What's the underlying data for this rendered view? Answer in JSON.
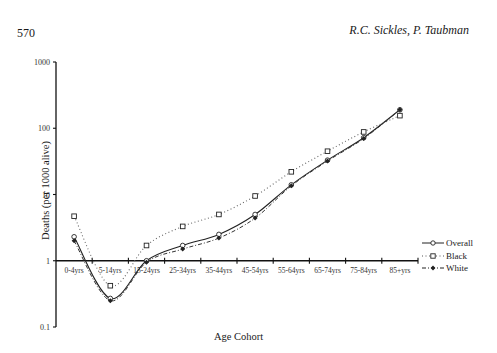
{
  "page": {
    "page_number": "570",
    "running_head": "R.C. Sickles, P. Taubman"
  },
  "chart_data": {
    "type": "line",
    "title": "",
    "xlabel": "Age Cohort",
    "ylabel": "Deaths (per 1000 alive)",
    "yscale": "log",
    "ylim": [
      0.1,
      1000
    ],
    "yticks": [
      "0.1",
      "1",
      "10",
      "100",
      "1000"
    ],
    "grid": false,
    "legend_position": "right",
    "categories": [
      "0-4yrs",
      "5-14yrs",
      "15-24yrs",
      "25-34yrs",
      "35-44yrs",
      "45-54yrs",
      "55-64yrs",
      "65-74yrs",
      "75-84yrs",
      "85+yrs"
    ],
    "series": [
      {
        "name": "Overall",
        "style": "solid",
        "marker": "open-circle",
        "values": [
          2.3,
          0.27,
          1.0,
          1.7,
          2.5,
          5.0,
          14,
          33,
          72,
          190
        ]
      },
      {
        "name": "Black",
        "style": "dotted",
        "marker": "open-square",
        "values": [
          4.7,
          0.42,
          1.7,
          3.3,
          5.0,
          9.5,
          22,
          45,
          88,
          155
        ]
      },
      {
        "name": "White",
        "style": "dash-dot",
        "marker": "filled-diamond",
        "values": [
          2.0,
          0.25,
          0.95,
          1.5,
          2.2,
          4.4,
          13.5,
          32,
          70,
          190
        ]
      }
    ]
  },
  "legend": {
    "items": [
      {
        "label": "Overall"
      },
      {
        "label": "Black"
      },
      {
        "label": "White"
      }
    ]
  }
}
